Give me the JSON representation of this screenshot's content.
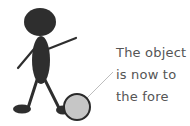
{
  "figure": {
    "colors": {
      "figure": "#2e2e2e",
      "ball_fill": "#c6c6c6",
      "ball_outline": "#2a2a2a",
      "pointer_line": "#bdbdbd",
      "text": "#555555"
    }
  },
  "caption": {
    "lines": [
      "The object",
      "is now to",
      "the fore"
    ]
  }
}
